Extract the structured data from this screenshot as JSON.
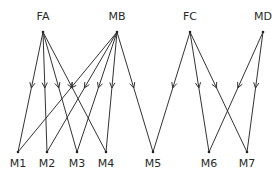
{
  "diagram": {
    "type": "bipartite-directed-graph",
    "top_nodes": [
      {
        "id": "FA",
        "label": "FA"
      },
      {
        "id": "MB",
        "label": "MB"
      },
      {
        "id": "FC",
        "label": "FC"
      },
      {
        "id": "MD",
        "label": "MD"
      }
    ],
    "bottom_nodes": [
      {
        "id": "M1",
        "label": "M1"
      },
      {
        "id": "M2",
        "label": "M2"
      },
      {
        "id": "M3",
        "label": "M3"
      },
      {
        "id": "M4",
        "label": "M4"
      },
      {
        "id": "M5",
        "label": "M5"
      },
      {
        "id": "M6",
        "label": "M6"
      },
      {
        "id": "M7",
        "label": "M7"
      }
    ],
    "edges": [
      {
        "from": "FA",
        "to": "M1"
      },
      {
        "from": "FA",
        "to": "M2"
      },
      {
        "from": "FA",
        "to": "M3"
      },
      {
        "from": "FA",
        "to": "M4"
      },
      {
        "from": "MB",
        "to": "M1"
      },
      {
        "from": "MB",
        "to": "M2"
      },
      {
        "from": "MB",
        "to": "M3"
      },
      {
        "from": "MB",
        "to": "M4"
      },
      {
        "from": "MB",
        "to": "M5"
      },
      {
        "from": "FC",
        "to": "M5"
      },
      {
        "from": "FC",
        "to": "M6"
      },
      {
        "from": "FC",
        "to": "M7"
      },
      {
        "from": "MD",
        "to": "M6"
      },
      {
        "from": "MD",
        "to": "M7"
      }
    ],
    "line_color": "#333333"
  }
}
